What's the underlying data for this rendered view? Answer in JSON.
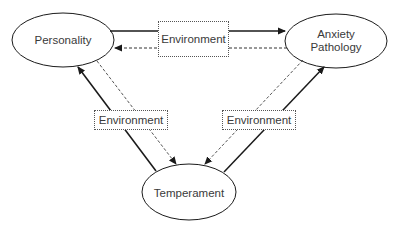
{
  "nodes": {
    "personality": {
      "label": "Personality"
    },
    "anxiety": {
      "line1": "Anxiety",
      "line2": "Pathology"
    },
    "temperament": {
      "label": "Temperament"
    }
  },
  "moderators": {
    "top": "Environment",
    "left": "Environment",
    "right": "Environment"
  },
  "edges": [
    {
      "from": "Personality",
      "to": "Anxiety Pathology",
      "style": "solid"
    },
    {
      "from": "Anxiety Pathology",
      "to": "Personality",
      "style": "dashed"
    },
    {
      "from": "Temperament",
      "to": "Personality",
      "style": "solid"
    },
    {
      "from": "Personality",
      "to": "Temperament",
      "style": "dashed"
    },
    {
      "from": "Temperament",
      "to": "Anxiety Pathology",
      "style": "solid"
    },
    {
      "from": "Anxiety Pathology",
      "to": "Temperament",
      "style": "dashed"
    }
  ],
  "colors": {
    "line": "#1a1a1a",
    "dashed": "#555555",
    "text": "#3a3a3a"
  }
}
